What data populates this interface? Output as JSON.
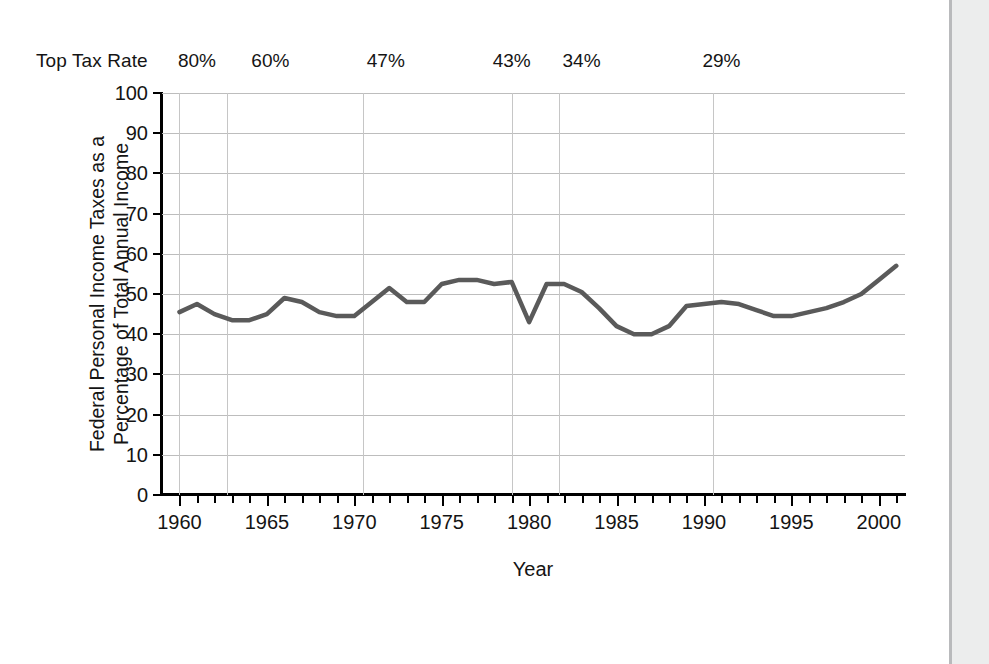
{
  "figure": {
    "toprate_caption": "Top Tax Rate",
    "toprate_marks": [
      {
        "label": "80%",
        "year": 1961.0
      },
      {
        "label": "60%",
        "year": 1965.2
      },
      {
        "label": "47%",
        "year": 1971.8
      },
      {
        "label": "43%",
        "year": 1979.0
      },
      {
        "label": "34%",
        "year": 1983.0
      },
      {
        "label": "29%",
        "year": 1991.0
      }
    ],
    "bracket_gridline_years": [
      1960.0,
      1962.7,
      1970.5,
      1979.0,
      1981.7,
      1990.5
    ],
    "line_color": "#5a5a5a",
    "grid_color": "#bdbdbd",
    "axis_color": "#000000"
  },
  "chart_data": {
    "type": "line",
    "title": "",
    "xlabel": "Year",
    "ylabel": "Federal Personal Income Taxes as a Percentage of Total Annual Income",
    "ylabel_lines": [
      "Federal Personal Income Taxes as a",
      "Percentage of Total Annual Income"
    ],
    "xlim": [
      1959.0,
      2001.5
    ],
    "ylim": [
      0,
      100
    ],
    "yticks": [
      0,
      10,
      20,
      30,
      40,
      50,
      60,
      70,
      80,
      90,
      100
    ],
    "xticks_major": [
      1960,
      1965,
      1970,
      1975,
      1980,
      1985,
      1990,
      1995,
      2000
    ],
    "xticks_minor_step": 1,
    "grid": "horizontal-and-bracket-verticals",
    "legend": "none",
    "series": [
      {
        "name": "Federal personal income taxes as % of total annual income",
        "x": [
          1960,
          1961,
          1962,
          1963,
          1964,
          1965,
          1966,
          1967,
          1968,
          1969,
          1970,
          1971,
          1972,
          1973,
          1974,
          1975,
          1976,
          1977,
          1978,
          1979,
          1980,
          1981,
          1982,
          1983,
          1984,
          1985,
          1986,
          1987,
          1988,
          1989,
          1990,
          1991,
          1992,
          1993,
          1994,
          1995,
          1996,
          1997,
          1998,
          1999,
          2000,
          2001
        ],
        "values": [
          45.5,
          47.5,
          45.0,
          43.5,
          43.5,
          45.0,
          49.0,
          48.0,
          45.5,
          44.5,
          44.5,
          48.0,
          51.5,
          48.0,
          48.0,
          52.5,
          53.5,
          53.5,
          52.5,
          53.0,
          43.0,
          52.5,
          52.5,
          50.5,
          46.5,
          42.0,
          40.0,
          40.0,
          42.0,
          47.0,
          47.5,
          48.0,
          47.5,
          46.0,
          44.5,
          44.5,
          45.5,
          46.5,
          48.0,
          50.0,
          53.5,
          57.0
        ]
      }
    ],
    "annotations": [
      {
        "text": "Top Tax Rate",
        "position": "above-plot-left"
      },
      {
        "text": "80%",
        "position": "above-plot"
      },
      {
        "text": "60%",
        "position": "above-plot"
      },
      {
        "text": "47%",
        "position": "above-plot"
      },
      {
        "text": "43%",
        "position": "above-plot"
      },
      {
        "text": "34%",
        "position": "above-plot"
      },
      {
        "text": "29%",
        "position": "above-plot"
      }
    ]
  }
}
